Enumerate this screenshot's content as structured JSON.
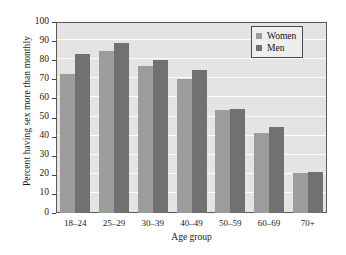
{
  "chart_data": {
    "type": "bar",
    "title": "",
    "subtitle": "",
    "xlabel": "Age group",
    "ylabel": "Percent having sex more than monthly",
    "categories": [
      "18–24",
      "25–29",
      "30–39",
      "40–49",
      "50–59",
      "60–69",
      "70+"
    ],
    "series": [
      {
        "name": "Women",
        "color": "#9c9c9c",
        "values": [
          73,
          85,
          77,
          70,
          54,
          42,
          21
        ]
      },
      {
        "name": "Men",
        "color": "#717171",
        "values": [
          83,
          89,
          80,
          75,
          54.5,
          45,
          21.5
        ]
      }
    ],
    "ylim": [
      0,
      100
    ],
    "ytick_labels": [
      "0",
      "10",
      "20",
      "30",
      "40",
      "50",
      "60",
      "70",
      "80",
      "90",
      "100"
    ],
    "ytick_values": [
      0,
      10,
      20,
      30,
      40,
      50,
      60,
      70,
      80,
      90,
      100
    ],
    "grid": true,
    "grid_color": "#fcfcfc",
    "legend_position": "upper right",
    "plot_background": "#e4e4e4",
    "figure_background": "#ffffff",
    "axis_color": "#5a5a5a"
  },
  "legend": {
    "entries": [
      {
        "label": "Women"
      },
      {
        "label": "Men"
      }
    ]
  }
}
